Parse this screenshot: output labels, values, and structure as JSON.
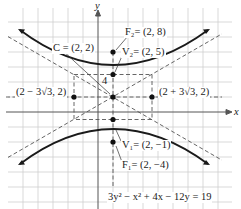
{
  "figure": {
    "axes": {
      "x_label": "x",
      "y_label": "y"
    },
    "scale_label": "4",
    "equation": "3y² − x² + 4x − 12y = 19",
    "points": [
      {
        "id": "F2",
        "label": "F₂= (2, 8)",
        "x": 2,
        "y": 8
      },
      {
        "id": "V2",
        "label": "V₂= (2, 5)",
        "x": 2,
        "y": 5
      },
      {
        "id": "C",
        "label": "C = (2, 2)",
        "x": 2,
        "y": 2
      },
      {
        "id": "V1",
        "label": "V₁= (2, −1)",
        "x": 2,
        "y": -1
      },
      {
        "id": "F1",
        "label": "F₁= (2, −4)",
        "x": 2,
        "y": -4
      },
      {
        "id": "L",
        "label": "(2 − 3√3, 2)",
        "x": -3.196,
        "y": 2
      },
      {
        "id": "R",
        "label": "(2 + 3√3, 2)",
        "x": 7.196,
        "y": 2
      }
    ],
    "colors": {
      "curve": "#1a1a1a",
      "grid": "#c8c8c8",
      "dashed": "#555555",
      "axis": "#555555"
    }
  }
}
